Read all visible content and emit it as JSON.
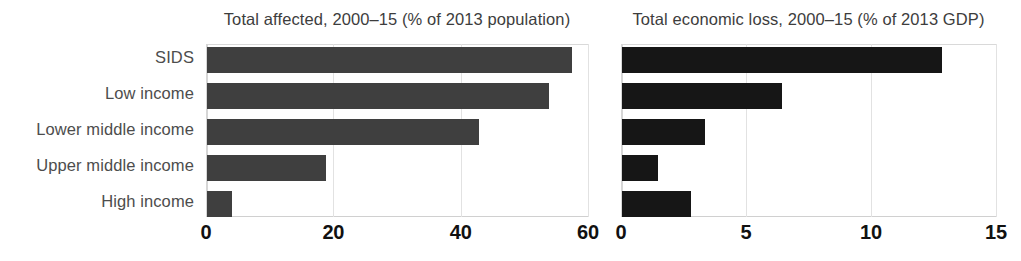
{
  "chart_data": {
    "type": "bar",
    "orientation": "horizontal",
    "grid": true,
    "legend": null,
    "categories": [
      "SIDS",
      "Low income",
      "Lower middle income",
      "Upper middle income",
      "High income"
    ],
    "panels": [
      {
        "id": "total-affected",
        "title": "Total affected, 2000–15 (% of 2013 population)",
        "xlabel": "",
        "ylabel": "",
        "xlim": [
          0,
          60
        ],
        "xticks": [
          0,
          20,
          40,
          60
        ],
        "xtick_labels": [
          "0",
          "20",
          "40",
          "60"
        ],
        "bar_color": "#3f3f3f",
        "series": [
          {
            "name": "Total affected, 2000–15 (% of 2013 population)",
            "values": [
              57.3,
              53.7,
              42.7,
              18.7,
              3.9
            ]
          }
        ]
      },
      {
        "id": "total-economic-loss",
        "title": "Total economic loss, 2000–15 (% of 2013 GDP)",
        "xlabel": "",
        "ylabel": "",
        "xlim": [
          0,
          15
        ],
        "xticks": [
          0,
          5,
          10,
          15
        ],
        "xtick_labels": [
          "0",
          "5",
          "10",
          "15"
        ],
        "bar_color": "#161616",
        "series": [
          {
            "name": "Total economic loss, 2000–15 (% of 2013 GDP)",
            "values": [
              12.8,
              6.4,
              3.3,
              1.45,
              2.75
            ]
          }
        ]
      }
    ]
  },
  "colors": {
    "background": "#ffffff",
    "bar_left": "#3f3f3f",
    "bar_right": "#161616",
    "gridline": "#e2e2e2",
    "category_label": "#4d4d4d",
    "title_text": "#3d3d3d",
    "tick_text": "#111111"
  }
}
